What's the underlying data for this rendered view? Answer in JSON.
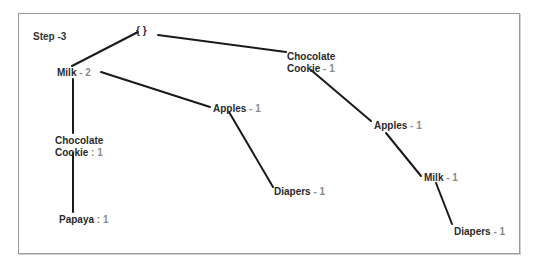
{
  "title": "Step -3",
  "root": {
    "label": "{ }"
  },
  "colors": {
    "label": "#2a2a2a",
    "count": "#8a8a8a",
    "edge": "#1a1a1a",
    "border": "#9a9a9a"
  },
  "nodes": [
    {
      "id": "milk_2",
      "line1": "Milk",
      "sep": " - ",
      "count": "2",
      "x": 57,
      "y": 67
    },
    {
      "id": "apples_1_left",
      "line1": "Apples",
      "sep": " - ",
      "count": "1",
      "x": 213,
      "y": 103
    },
    {
      "id": "diapers_1_left",
      "line1": "Diapers",
      "sep": " - ",
      "count": "1",
      "x": 274,
      "y": 186
    },
    {
      "id": "choc_cookie_colon",
      "line1": "Chocolate",
      "line2": "Cookie",
      "sep": " : ",
      "count": "1",
      "x": 55,
      "y": 135
    },
    {
      "id": "papaya_1",
      "line1": "Papaya",
      "sep": " : ",
      "count": "1",
      "x": 59,
      "y": 214
    },
    {
      "id": "choc_cookie_dash",
      "line1": "Chocolate",
      "line2": "Cookie",
      "sep": " - ",
      "count": "1",
      "x": 287,
      "y": 51
    },
    {
      "id": "apples_1_right",
      "line1": "Apples",
      "sep": " - ",
      "count": "1",
      "x": 374,
      "y": 120
    },
    {
      "id": "milk_1",
      "line1": "Milk",
      "sep": " - ",
      "count": "1",
      "x": 424,
      "y": 172
    },
    {
      "id": "diapers_1_right",
      "line1": "Diapers",
      "sep": " - ",
      "count": "1",
      "x": 454,
      "y": 226
    }
  ],
  "edges": [
    {
      "from": "root",
      "to": "milk_2",
      "x1": 138,
      "y1": 32,
      "x2": 72,
      "y2": 66
    },
    {
      "from": "root",
      "to": "choc_cookie_dash",
      "x1": 158,
      "y1": 35,
      "x2": 286,
      "y2": 52
    },
    {
      "from": "milk_2",
      "to": "apples_1_left",
      "x1": 101,
      "y1": 72,
      "x2": 210,
      "y2": 107
    },
    {
      "from": "milk_2",
      "to": "choc_cookie_colon",
      "x1": 73,
      "y1": 79,
      "x2": 73,
      "y2": 133
    },
    {
      "from": "apples_1_left",
      "to": "diapers_1_left",
      "x1": 229,
      "y1": 112,
      "x2": 273,
      "y2": 187
    },
    {
      "from": "choc_cookie_colon",
      "to": "papaya_1",
      "x1": 73,
      "y1": 153,
      "x2": 73,
      "y2": 212
    },
    {
      "from": "choc_cookie_dash",
      "to": "apples_1_right",
      "x1": 311,
      "y1": 70,
      "x2": 371,
      "y2": 121
    },
    {
      "from": "apples_1_right",
      "to": "milk_1",
      "x1": 386,
      "y1": 133,
      "x2": 421,
      "y2": 176
    },
    {
      "from": "milk_1",
      "to": "diapers_1_right",
      "x1": 436,
      "y1": 183,
      "x2": 452,
      "y2": 224
    }
  ]
}
